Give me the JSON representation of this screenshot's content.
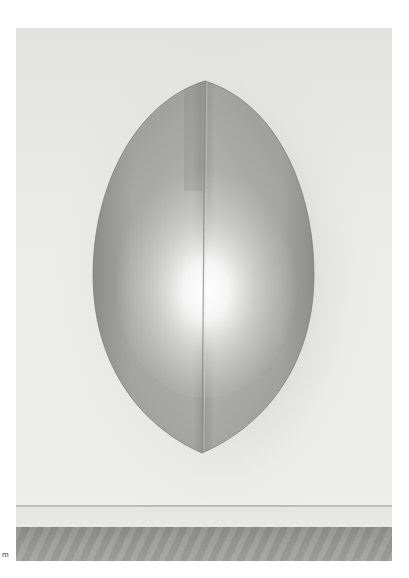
{
  "image": {
    "subject": "lens-shaped grey metallic wall sculpture with a vertical centre seam and a bright central glow, photographed on a white gallery wall above a wooden floor",
    "colors": {
      "page_background": "#ffffff",
      "wall": "#ebebea",
      "sculpture_edge": "#8e8e8c",
      "sculpture_mid": "#b4b4b2",
      "sculpture_glow": "#fbfbfb",
      "floor": "#9a9a98"
    }
  },
  "caption": {
    "fragment": "m"
  }
}
